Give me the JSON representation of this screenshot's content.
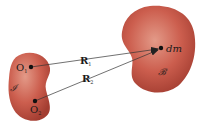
{
  "diagram": {
    "type": "vector-diagram",
    "bodies": [
      {
        "id": "left",
        "label": "𝓘",
        "color": "#c8584a"
      },
      {
        "id": "right",
        "label": "𝓑",
        "color": "#c8584a"
      }
    ],
    "points": [
      {
        "id": "O1",
        "label": "O",
        "subscript": "1"
      },
      {
        "id": "O2",
        "label": "O",
        "subscript": "2"
      },
      {
        "id": "dm",
        "label": "dm"
      }
    ],
    "vectors": [
      {
        "from": "O1",
        "to": "dm",
        "label": "R",
        "subscript": "1"
      },
      {
        "from": "O2",
        "to": "dm",
        "label": "R",
        "subscript": "2"
      }
    ]
  },
  "colors": {
    "body_fill": "#c8584a",
    "body_highlight": "#e08a7a",
    "body_shadow": "#9e3a30",
    "line": "#333333",
    "text": "#1a1a1a"
  }
}
